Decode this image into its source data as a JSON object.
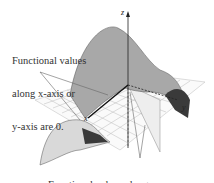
{
  "figure": {
    "annotations": [
      {
        "id": "axes",
        "lines": [
          "Functional values",
          "along x-axis or",
          "y-axis are 0."
        ]
      },
      {
        "id": "diagonal",
        "lines": [
          "Functional values along",
          "y = x are 1."
        ]
      }
    ],
    "axes": {
      "z": "z",
      "x": "x",
      "y": "y"
    },
    "colors": {
      "surface_light": "#d9d9d9",
      "surface_mid": "#a8a8a8",
      "surface_dark": "#3a3a3a",
      "grid": "#bbbbbb",
      "leader": "#666666",
      "plane": "#eeeeee"
    }
  }
}
